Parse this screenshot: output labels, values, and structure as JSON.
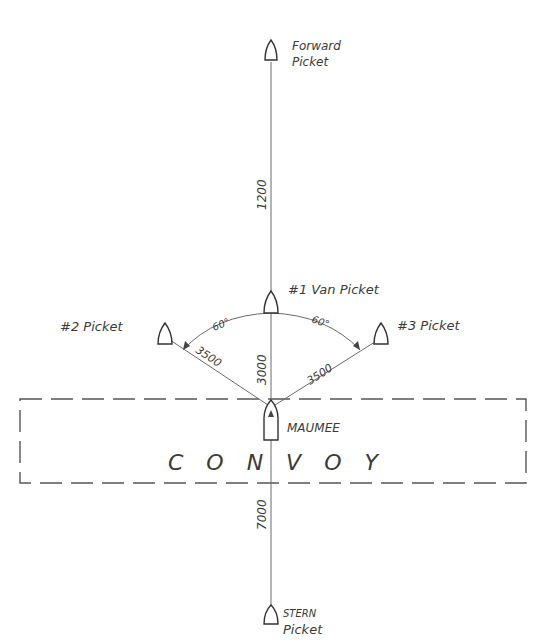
{
  "diagram": {
    "type": "naval picket formation",
    "ships": {
      "forward_picket": {
        "line1": "Forward",
        "line2": "Picket"
      },
      "van_picket": {
        "label": "#1 Van Picket"
      },
      "picket_2": {
        "label": "#2 Picket"
      },
      "picket_3": {
        "label": "#3 Picket"
      },
      "maumee": {
        "label": "MAUMEE"
      },
      "stern_picket": {
        "line1": "STERN",
        "line2": "Picket"
      }
    },
    "distances": {
      "forward_to_van": "1200",
      "van_to_maumee": "3000",
      "picket2_to_maumee": "3500",
      "picket3_to_maumee": "3500",
      "maumee_to_stern": "7000"
    },
    "angles": {
      "left": "60°",
      "right": "60°"
    },
    "convoy": {
      "label": "C O N V O Y"
    }
  }
}
